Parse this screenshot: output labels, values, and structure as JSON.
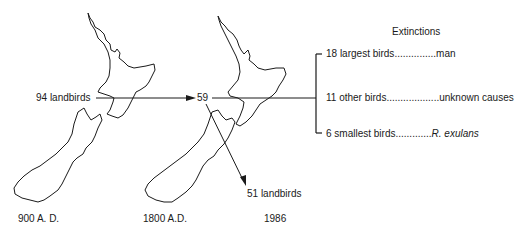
{
  "diagram": {
    "title": "Extinctions",
    "maps": [
      {
        "id": "map-900",
        "date_label": "900 A. D.",
        "count_label": "94 landbirds"
      },
      {
        "id": "map-1800",
        "date_label": "1800 A.D.",
        "count_label": "59"
      },
      {
        "id": "map-1986",
        "date_label": "1986",
        "count_label": "51 landbirds"
      }
    ],
    "extinctions": [
      {
        "count_group": "18 largest birds",
        "leader": "...............",
        "cause": "man",
        "cause_italic": false
      },
      {
        "count_group": "11 other birds",
        "leader": "...................",
        "cause": "unknown causes",
        "cause_italic": false
      },
      {
        "count_group": "6 smallest birds",
        "leader": ".............",
        "cause": "R. exulans",
        "cause_italic": true
      }
    ],
    "colors": {
      "line": "#1a1a1a",
      "background": "#ffffff"
    }
  }
}
